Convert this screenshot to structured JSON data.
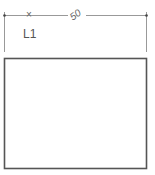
{
  "dimension": {
    "value": "50",
    "label": "L1",
    "marker": "×"
  },
  "colors": {
    "line": "#555555",
    "dim_line": "#888888",
    "background": "#ffffff"
  }
}
